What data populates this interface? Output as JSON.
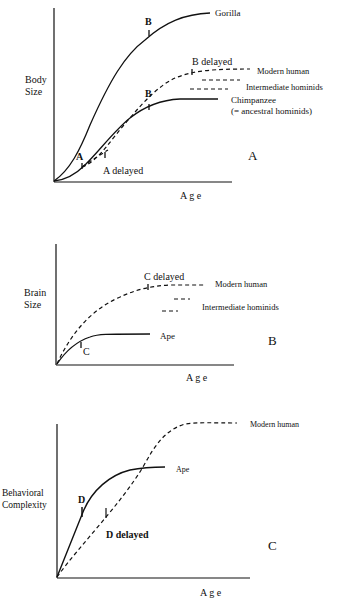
{
  "panels": [
    {
      "id": "A",
      "panel_letter": "A",
      "ylabel_line1": "Body",
      "ylabel_line2": "Size",
      "xlabel": "A g e",
      "curves": [
        {
          "name": "Gorilla",
          "style": "solid",
          "path": "M54,181 C70,170 80,150 90,125 C110,80 125,55 145,40 C165,22 185,14 210,13"
        },
        {
          "name": "Chimpanzee (= ancestral hominids)",
          "style": "solid",
          "path": "M54,181 C65,180 75,175 85,165 C100,150 115,130 130,118 C145,106 160,100 180,99 L218,99"
        },
        {
          "name": "Modern human",
          "style": "dashed",
          "path": "M82,167 C100,160 110,140 130,118 C145,100 160,85 175,78 C195,70 215,69 250,69"
        },
        {
          "name": "A delayed path",
          "style": "dashed",
          "path": "M82,167 C92,160 100,155 108,150"
        }
      ],
      "dash_levels": [
        {
          "name": "Intermediate hominids (upper)",
          "x1": 202,
          "x2": 240,
          "y": 80
        },
        {
          "name": "Intermediate hominids (lower)",
          "x1": 190,
          "x2": 228,
          "y": 89
        }
      ],
      "labels": {
        "gorilla": "Gorilla",
        "modern_human": "Modern human",
        "intermediate": "Intermediate hominids",
        "chimp_line1": "Chimpanzee",
        "chimp_line2": "(= ancestral hominids)",
        "b_top": "B",
        "b_mid": "B",
        "b_delayed": "B delayed",
        "a": "A",
        "a_delayed": "A delayed"
      }
    },
    {
      "id": "B",
      "panel_letter": "B",
      "ylabel_line1": "Brain",
      "ylabel_line2": "Size",
      "xlabel": "A g e",
      "curves": [
        {
          "name": "Ape",
          "style": "solid",
          "path": "M57,364 C65,352 75,342 90,337 C98,334 104,334 150,334"
        },
        {
          "name": "Modern human",
          "style": "dashed",
          "path": "M57,364 C70,335 90,310 120,297 C135,290 150,286 170,285 L205,285"
        }
      ],
      "dash_levels": [
        {
          "name": "Intermediate hominids (upper)",
          "x1": 174,
          "x2": 190,
          "y": 299
        },
        {
          "name": "Intermediate hominids (lower)",
          "x1": 162,
          "x2": 178,
          "y": 311
        }
      ],
      "labels": {
        "c_delayed": "C delayed",
        "modern_human": "Modern human",
        "intermediate": "Intermediate hominids",
        "ape": "Ape",
        "c": "C"
      }
    },
    {
      "id": "C",
      "panel_letter": "C",
      "ylabel_line1": "Behavioral",
      "ylabel_line2": "Complexity",
      "xlabel": "A g e",
      "curves": [
        {
          "name": "Ape",
          "style": "solid",
          "path": "M57,577 L83,512 C92,490 110,475 130,470 C140,468 148,467 165,467"
        },
        {
          "name": "Modern human",
          "style": "dashed",
          "path": "M57,577 C80,545 120,505 143,467 C155,445 165,430 185,424 C200,422 215,423 237,423"
        }
      ],
      "dash_levels": [],
      "labels": {
        "modern_human": "Modern human",
        "ape": "Ape",
        "d": "D",
        "d_delayed": "D delayed"
      }
    }
  ]
}
